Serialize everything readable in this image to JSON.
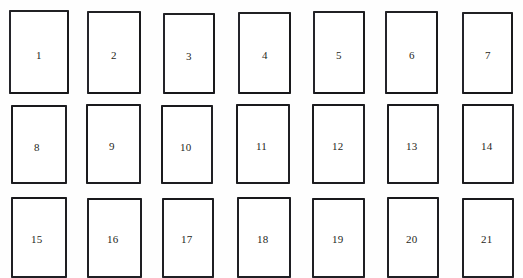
{
  "figure": {
    "name": "numbered-rectangle-grid",
    "caption_remnant": "",
    "background_color": "#fefefe",
    "border_color": "#1d1d1f",
    "label_color": "#1f1f22",
    "columns": 7,
    "rows": 3,
    "total_cells": 21
  },
  "cells": [
    {
      "label": "1",
      "row": 1,
      "col": 1,
      "x": 9,
      "y": 10,
      "w": 60,
      "h": 84,
      "label_dx": 25,
      "label_dy": 38
    },
    {
      "label": "2",
      "row": 1,
      "col": 2,
      "x": 87,
      "y": 11,
      "w": 54,
      "h": 83,
      "label_dx": 22,
      "label_dy": 37
    },
    {
      "label": "3",
      "row": 1,
      "col": 3,
      "x": 163,
      "y": 13,
      "w": 52,
      "h": 81,
      "label_dx": 21,
      "label_dy": 36
    },
    {
      "label": "4",
      "row": 1,
      "col": 4,
      "x": 238,
      "y": 12,
      "w": 53,
      "h": 82,
      "label_dx": 22,
      "label_dy": 36
    },
    {
      "label": "5",
      "row": 1,
      "col": 5,
      "x": 313,
      "y": 11,
      "w": 52,
      "h": 83,
      "label_dx": 21,
      "label_dy": 37
    },
    {
      "label": "6",
      "row": 1,
      "col": 6,
      "x": 385,
      "y": 11,
      "w": 53,
      "h": 83,
      "label_dx": 22,
      "label_dy": 37
    },
    {
      "label": "7",
      "row": 1,
      "col": 7,
      "x": 462,
      "y": 12,
      "w": 51,
      "h": 82,
      "label_dx": 21,
      "label_dy": 36
    },
    {
      "label": "8",
      "row": 2,
      "col": 1,
      "x": 11,
      "y": 105,
      "w": 56,
      "h": 79,
      "label_dx": 21,
      "label_dy": 35
    },
    {
      "label": "9",
      "row": 2,
      "col": 2,
      "x": 86,
      "y": 104,
      "w": 55,
      "h": 80,
      "label_dx": 21,
      "label_dy": 35
    },
    {
      "label": "10",
      "row": 2,
      "col": 3,
      "x": 161,
      "y": 105,
      "w": 52,
      "h": 79,
      "label_dx": 17,
      "label_dy": 35
    },
    {
      "label": "11",
      "row": 2,
      "col": 4,
      "x": 236,
      "y": 104,
      "w": 54,
      "h": 80,
      "label_dx": 18,
      "label_dy": 35
    },
    {
      "label": "12",
      "row": 2,
      "col": 5,
      "x": 312,
      "y": 104,
      "w": 53,
      "h": 80,
      "label_dx": 18,
      "label_dy": 35
    },
    {
      "label": "13",
      "row": 2,
      "col": 6,
      "x": 387,
      "y": 104,
      "w": 52,
      "h": 80,
      "label_dx": 17,
      "label_dy": 35
    },
    {
      "label": "14",
      "row": 2,
      "col": 7,
      "x": 462,
      "y": 104,
      "w": 52,
      "h": 80,
      "label_dx": 17,
      "label_dy": 35
    },
    {
      "label": "15",
      "row": 3,
      "col": 1,
      "x": 11,
      "y": 197,
      "w": 56,
      "h": 81,
      "label_dx": 18,
      "label_dy": 35
    },
    {
      "label": "16",
      "row": 3,
      "col": 2,
      "x": 87,
      "y": 198,
      "w": 55,
      "h": 80,
      "label_dx": 18,
      "label_dy": 34
    },
    {
      "label": "17",
      "row": 3,
      "col": 3,
      "x": 162,
      "y": 198,
      "w": 52,
      "h": 80,
      "label_dx": 17,
      "label_dy": 34
    },
    {
      "label": "18",
      "row": 3,
      "col": 4,
      "x": 237,
      "y": 197,
      "w": 54,
      "h": 81,
      "label_dx": 18,
      "label_dy": 35
    },
    {
      "label": "19",
      "row": 3,
      "col": 5,
      "x": 312,
      "y": 198,
      "w": 53,
      "h": 80,
      "label_dx": 18,
      "label_dy": 34
    },
    {
      "label": "20",
      "row": 3,
      "col": 6,
      "x": 387,
      "y": 197,
      "w": 52,
      "h": 81,
      "label_dx": 17,
      "label_dy": 35
    },
    {
      "label": "21",
      "row": 3,
      "col": 7,
      "x": 462,
      "y": 198,
      "w": 52,
      "h": 80,
      "label_dx": 17,
      "label_dy": 34
    }
  ]
}
